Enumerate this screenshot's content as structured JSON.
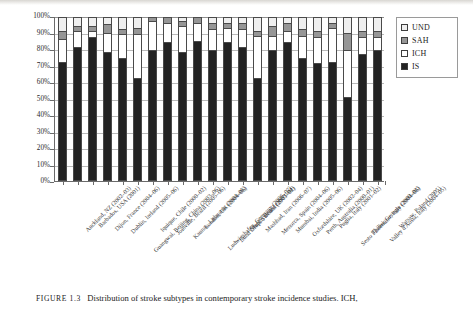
{
  "caption": {
    "figure_tag": "FIGURE 1.3",
    "text": "Distribution of stroke subtypes in contemporary stroke incidence studies. ICH,"
  },
  "legend": {
    "position": "top-right-outside",
    "items": [
      {
        "label": "UND",
        "color": "#efefef",
        "key": "UND"
      },
      {
        "label": "SAH",
        "color": "#969696",
        "key": "SAH"
      },
      {
        "label": "ICH",
        "color": "#ffffff",
        "key": "ICH"
      },
      {
        "label": "IS",
        "color": "#232323",
        "key": "IS"
      }
    ]
  },
  "chart_data": {
    "type": "bar",
    "subtype": "stacked-percentage",
    "title": "",
    "xlabel": "",
    "ylabel": "",
    "ylim": [
      0,
      100
    ],
    "ytick_labels": [
      "100%",
      "90%",
      "80%",
      "70%",
      "60%",
      "50%",
      "40%",
      "30%",
      "20%",
      "10%",
      "0%"
    ],
    "ytick_values": [
      100,
      90,
      80,
      70,
      60,
      50,
      40,
      30,
      20,
      10,
      0
    ],
    "grid": true,
    "legend_position": "right",
    "stack_order_bottom_to_top": [
      "IS",
      "ICH",
      "SAH",
      "UND"
    ],
    "categories": [
      "Auckland, NZ (2002–03)",
      "Barbados, USA (2001)",
      "Dijon, France (2004–06)",
      "Dublin, Ireland (2005–06)",
      "Guangwai, Beijing, China (2003–06)",
      "Iquique, Chile (2000–02)",
      "Joinville, Brazil (2005–06)",
      "Kaunas, Lithuania (2004–05)",
      "London, UK (2004–06)",
      "Ludwigshafen, Germany (2006–07)",
      "Lund Orup, Sweden (2001–02)",
      "Matão, Brazil (2003–04)",
      "Mashhad, Iran (2006–07)",
      "Menorca, Spain (2004–06)",
      "Mumbai, India (2005–06)",
      "Oxfordshire, UK (2002–04)",
      "Perth, Australia (2000–01)",
      "Puglia, Italy (2001–02)",
      "Sesto Fiorentino, Italy (2004–06)",
      "Tbilisi, Georgia (2000–03)",
      "Valley d'Aosta, Italy (2004–05)",
      "Warsaw, Poland (2005)"
    ],
    "series": [
      {
        "name": "IS",
        "color": "#232323",
        "values": [
          73,
          82,
          88,
          79,
          75,
          63,
          80,
          85,
          79,
          86,
          80,
          85,
          82,
          63,
          80,
          85,
          75,
          72,
          73,
          51,
          78,
          80
        ]
      },
      {
        "name": "ICH",
        "color": "#ffffff",
        "values": [
          14,
          10,
          4,
          12,
          15,
          27,
          18,
          12,
          16,
          11,
          13,
          9,
          11,
          26,
          9,
          7,
          14,
          16,
          21,
          29,
          10,
          8
        ]
      },
      {
        "name": "SAH",
        "color": "#969696",
        "values": [
          5,
          3,
          3,
          5,
          3,
          4,
          2,
          3,
          3,
          3,
          4,
          3,
          4,
          3,
          6,
          5,
          4,
          4,
          3,
          11,
          4,
          4
        ]
      },
      {
        "name": "UND",
        "color": "#efefef",
        "values": [
          8,
          5,
          5,
          4,
          7,
          6,
          0,
          0,
          2,
          0,
          3,
          3,
          3,
          8,
          5,
          3,
          7,
          8,
          3,
          9,
          8,
          8
        ]
      }
    ]
  }
}
